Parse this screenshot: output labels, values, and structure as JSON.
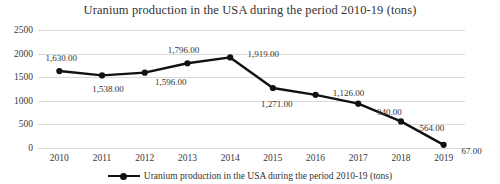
{
  "chart_data": {
    "type": "line",
    "title": "Uranium production in the USA during the period 2010-19  (tons)",
    "xlabel": "",
    "ylabel": "",
    "grid": true,
    "legend_position": "bottom",
    "ylim": [
      0,
      2500
    ],
    "yticks": [
      "0",
      "500",
      "1000",
      "1500",
      "2000",
      "2500"
    ],
    "ytick_values": [
      0,
      500,
      1000,
      1500,
      2000,
      2500
    ],
    "categories": [
      "2010",
      "2011",
      "2012",
      "2013",
      "2014",
      "2015",
      "2016",
      "2017",
      "2018",
      "2019"
    ],
    "values": [
      1630,
      1538,
      1596,
      1796,
      1919,
      1271,
      1126,
      940,
      564,
      67
    ],
    "point_labels": [
      "1,630.00",
      "1,538.00",
      "1,596.00",
      "1,796.00",
      "1,919.00",
      "1,271.00",
      "1,126.00",
      "940.00",
      "564.00",
      "67.00"
    ],
    "series": [
      {
        "name": "Uranium production in the USA during the period 2010-19  (tons)",
        "values": [
          1630,
          1538,
          1596,
          1796,
          1919,
          1271,
          1126,
          940,
          564,
          67
        ],
        "color": "#111111",
        "marker": "circle"
      }
    ],
    "legend": [
      "Uranium production in the USA during the period 2010-19  (tons)"
    ],
    "colors": {
      "line": "#111111",
      "marker": "#111111",
      "grid": "#d9d9d9",
      "text": "#333333",
      "background": "#ffffff"
    }
  }
}
